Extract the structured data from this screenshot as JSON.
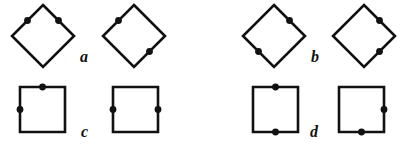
{
  "figure": {
    "background_color": "#ffffff",
    "stroke_color": "#111111",
    "dot_color": "#111111",
    "stroke_width": 2.6,
    "dot_radius": 3.4,
    "groups": [
      {
        "id": "a",
        "label": "a",
        "label_x": 80,
        "label_y": 49,
        "shapes": [
          {
            "id": "a1",
            "name": "diamond",
            "kind": "diamond",
            "x": 12,
            "y": 5,
            "size": 62,
            "dots": [
              "upper-left",
              "upper-right"
            ],
            "dot_relation": "adjacent"
          },
          {
            "id": "a2",
            "name": "diamond",
            "kind": "diamond",
            "x": 103,
            "y": 5,
            "size": 62,
            "dots": [
              "upper-left",
              "lower-right"
            ],
            "dot_relation": "opposite"
          }
        ]
      },
      {
        "id": "b",
        "label": "b",
        "label_x": 311,
        "label_y": 49,
        "shapes": [
          {
            "id": "b1",
            "name": "diamond",
            "kind": "diamond",
            "x": 243,
            "y": 5,
            "size": 62,
            "dots": [
              "upper-right",
              "lower-left"
            ],
            "dot_relation": "opposite"
          },
          {
            "id": "b2",
            "name": "diamond",
            "kind": "diamond",
            "x": 333,
            "y": 5,
            "size": 62,
            "dots": [
              "upper-right",
              "lower-right"
            ],
            "dot_relation": "adjacent"
          }
        ]
      },
      {
        "id": "c",
        "label": "c",
        "label_x": 81,
        "label_y": 124,
        "shapes": [
          {
            "id": "c1",
            "name": "square",
            "kind": "square",
            "x": 20,
            "y": 87,
            "size": 45,
            "dots": [
              "top",
              "left"
            ],
            "dot_relation": "adjacent"
          },
          {
            "id": "c2",
            "name": "square",
            "kind": "square",
            "x": 113,
            "y": 87,
            "size": 45,
            "dots": [
              "left",
              "right"
            ],
            "dot_relation": "opposite"
          }
        ]
      },
      {
        "id": "d",
        "label": "d",
        "label_x": 310,
        "label_y": 124,
        "shapes": [
          {
            "id": "d1",
            "name": "square",
            "kind": "square",
            "x": 253,
            "y": 87,
            "size": 45,
            "dots": [
              "top",
              "bottom"
            ],
            "dot_relation": "opposite"
          },
          {
            "id": "d2",
            "name": "square",
            "kind": "square",
            "x": 339,
            "y": 87,
            "size": 45,
            "dots": [
              "right",
              "bottom"
            ],
            "dot_relation": "adjacent"
          }
        ]
      }
    ]
  }
}
